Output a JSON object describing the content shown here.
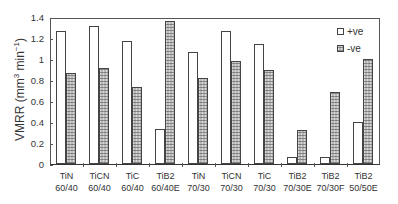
{
  "chart_data": {
    "type": "bar",
    "title": "",
    "xlabel": "",
    "ylabel": "VMRR (mm3 min-1)",
    "ylabel_parts": {
      "main": "VMRR (mm",
      "sup1": "3",
      "mid": " min",
      "sup2": "−1",
      "end": ")"
    },
    "ylim": [
      0,
      1.4
    ],
    "yticks": [
      "0",
      "0.2",
      "0.4",
      "0.6",
      "0.8",
      "1",
      "1.2",
      "1.4"
    ],
    "grid": false,
    "legend_position": "upper right",
    "categories": [
      {
        "line1": "TiN",
        "line2": "60/40"
      },
      {
        "line1": "TiCN",
        "line2": "60/40"
      },
      {
        "line1": "TiC",
        "line2": "60/40"
      },
      {
        "line1": "TiB2",
        "line2": "60/40E"
      },
      {
        "line1": "TiN",
        "line2": "70/30"
      },
      {
        "line1": "TiCN",
        "line2": "70/30"
      },
      {
        "line1": "TiC",
        "line2": "70/30"
      },
      {
        "line1": "TiB2",
        "line2": "70/30E"
      },
      {
        "line1": "TiB2",
        "line2": "70/30F"
      },
      {
        "line1": "TiB2",
        "line2": "50/50E"
      }
    ],
    "series": [
      {
        "name": "+ve",
        "style": "open",
        "values": [
          1.27,
          1.31,
          1.17,
          0.33,
          1.07,
          1.27,
          1.14,
          0.07,
          0.07,
          0.4
        ]
      },
      {
        "name": "-ve",
        "style": "hatched",
        "values": [
          0.87,
          0.91,
          0.73,
          1.36,
          0.82,
          0.98,
          0.9,
          0.32,
          0.69,
          1.0
        ]
      }
    ]
  }
}
